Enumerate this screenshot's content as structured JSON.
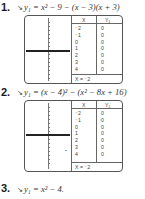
{
  "problems": [
    {
      "number": "1.",
      "equation": "y₁ = x² − 9 − (x − 3)(x + 3)",
      "table": {
        "headers": [
          "X",
          "Y₁"
        ],
        "rows": [
          {
            "x": "⁻2",
            "y": "0"
          },
          {
            "x": "⁻1",
            "y": "0"
          },
          {
            "x": "0",
            "y": "0"
          },
          {
            "x": "1",
            "y": "0"
          },
          {
            "x": "2",
            "y": "0"
          },
          {
            "x": "3",
            "y": "0"
          },
          {
            "x": "4",
            "y": "0"
          }
        ],
        "footer": "X = ⁻2"
      }
    },
    {
      "number": "2.",
      "equation": "y₁ = (x − 4)² − (x² − 8x + 16)",
      "table": {
        "headers": [
          "X",
          "Y₁"
        ],
        "rows": [
          {
            "x": "⁻2",
            "y": "0"
          },
          {
            "x": "⁻1",
            "y": "0"
          },
          {
            "x": "0",
            "y": "0"
          },
          {
            "x": "1",
            "y": "0"
          },
          {
            "x": "2",
            "y": "0"
          },
          {
            "x": "3",
            "y": "0"
          },
          {
            "x": "4",
            "y": "0"
          }
        ],
        "footer": "X = ⁻2"
      }
    },
    {
      "number": "3.",
      "equation": "y₁ = x² − 4."
    }
  ],
  "icons": {
    "arrow": "↘"
  }
}
